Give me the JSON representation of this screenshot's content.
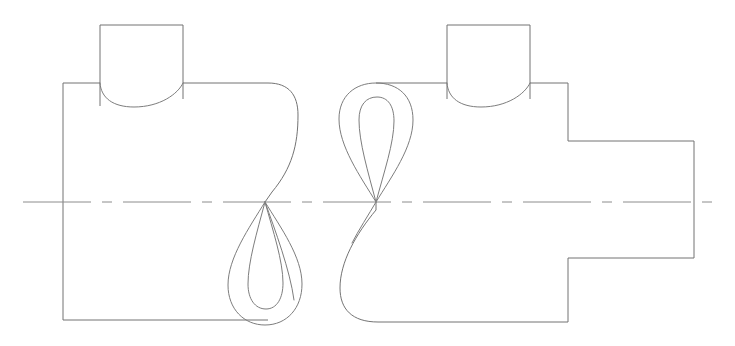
{
  "drawing": {
    "title": "Two-view orthographic engineering drawing",
    "description": "Front view and side view of a cylindrical body with top boss and projecting shaft, showing cylinder intersection curves",
    "canvas": {
      "width": 735,
      "height": 346,
      "background": "#ffffff"
    },
    "style": {
      "outline_color": "#737373",
      "intersection_color": "#7d7d7d",
      "centerline_color": "#8c8c8c",
      "line_width": 1
    },
    "centerline": {
      "name": "horizontal-axis-centerline",
      "y": 202,
      "x_start": 23,
      "x_end": 713,
      "dash_pattern": "68 11 10 11"
    },
    "views": [
      {
        "id": "left-view",
        "name": "front-view",
        "body": {
          "left": 63,
          "top": 83,
          "bottom": 320,
          "right_extent": 298,
          "description": "Rectangular body with rounded right-upper corner sweeping to cusp"
        },
        "boss": {
          "name": "top-boss",
          "left": 100,
          "right": 183,
          "top": 25,
          "base_y": 83,
          "arc_bottom_y": 106,
          "description": "Rectangular boss with arc intersection curve at base"
        },
        "cusp": {
          "x": 265,
          "y": 202
        },
        "teardrop": {
          "name": "intersection-teardrop",
          "apex_x": 265,
          "apex_y": 202,
          "bottom_y": 325,
          "outer_half_width": 37,
          "inner_half_width": 17,
          "orientation": "downward"
        }
      },
      {
        "id": "right-view",
        "name": "side-view",
        "body": {
          "left_extent": 340,
          "top": 83,
          "bottom": 322,
          "right": 568,
          "description": "Body with rounded lower-left corner sweeping up to cusp"
        },
        "boss": {
          "name": "top-boss",
          "left": 447,
          "right": 530,
          "top": 25,
          "base_y": 83,
          "arc_bottom_y": 106,
          "description": "Rectangular boss with arc intersection curve at base"
        },
        "cusp": {
          "x": 376,
          "y": 202
        },
        "teardrop": {
          "name": "intersection-teardrop",
          "apex_x": 376,
          "apex_y": 202,
          "top_y": 83,
          "outer_half_width": 37,
          "inner_half_width": 17,
          "orientation": "upward"
        },
        "shaft": {
          "name": "projecting-shaft",
          "left": 568,
          "right": 694,
          "top": 141,
          "bottom": 258,
          "description": "Rectangular shaft projecting from right side of body"
        }
      }
    ]
  }
}
